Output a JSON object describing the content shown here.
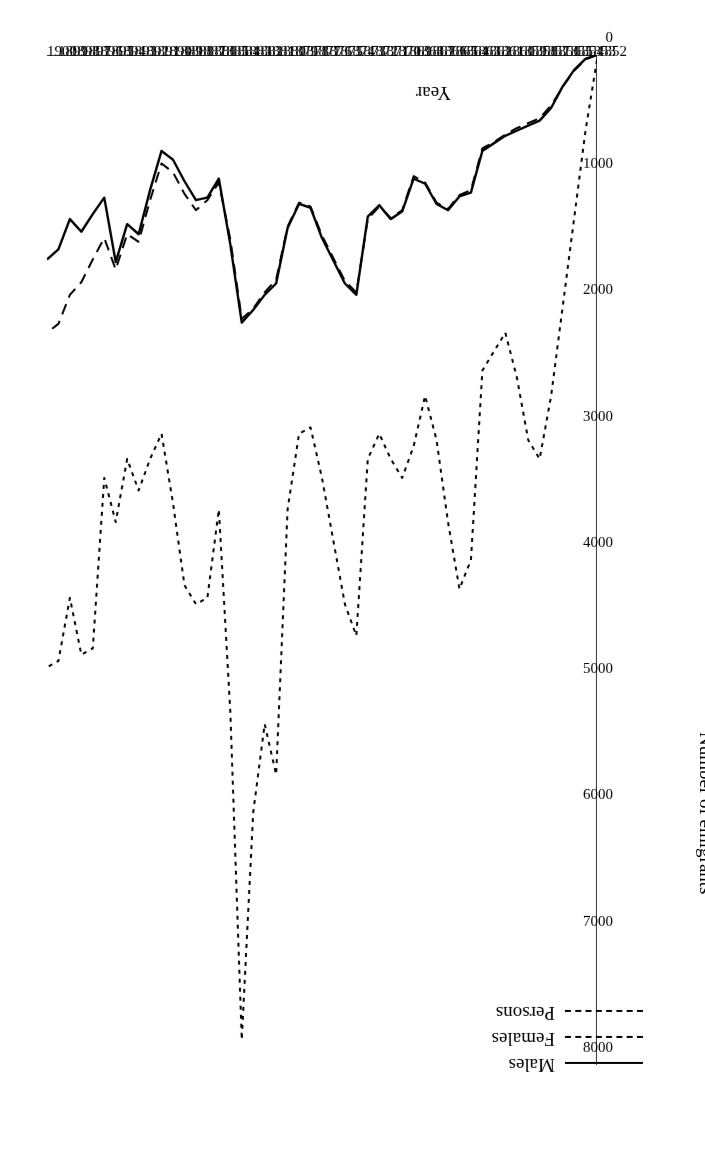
{
  "chart_data": {
    "type": "line",
    "title": "",
    "xlabel": "Year",
    "ylabel": "Number of emigrants",
    "xlim": [
      1852,
      1900
    ],
    "ylim": [
      0,
      8000
    ],
    "yticks": [
      0,
      1000,
      2000,
      3000,
      4000,
      5000,
      6000,
      7000,
      8000
    ],
    "ytick_labels": [
      "0",
      "1000",
      "2000",
      "3000",
      "4000",
      "5000",
      "6000",
      "7000",
      "8000"
    ],
    "grid": false,
    "legend_position": "upper-left",
    "rotation_deg": 180,
    "x": [
      1852,
      1853,
      1854,
      1855,
      1856,
      1857,
      1858,
      1859,
      1860,
      1861,
      1862,
      1863,
      1864,
      1865,
      1866,
      1867,
      1868,
      1869,
      1870,
      1871,
      1872,
      1873,
      1874,
      1875,
      1876,
      1877,
      1878,
      1879,
      1880,
      1881,
      1882,
      1883,
      1884,
      1885,
      1886,
      1887,
      1888,
      1889,
      1890,
      1891,
      1892,
      1893,
      1894,
      1895,
      1896,
      1897,
      1898,
      1899,
      1900
    ],
    "xtick_labels": [
      "1852",
      "1853",
      "1854",
      "1855",
      "1856",
      "1857",
      "1858",
      "1859",
      "1860",
      "1861",
      "1862",
      "1863",
      "1864",
      "1865",
      "1866",
      "1867",
      "1868",
      "1869",
      "1870",
      "1871",
      "1872",
      "1873",
      "1874",
      "1875",
      "1876",
      "1877",
      "1878",
      "1879",
      "1880",
      "1881",
      "1882",
      "1883",
      "1884",
      "1885",
      "1886",
      "1887",
      "1888",
      "1889",
      "1890",
      "1891",
      "1892",
      "1893",
      "1894",
      "1895",
      "1896",
      "1897",
      "1898",
      "1899",
      "1900"
    ],
    "series": [
      {
        "name": "Males",
        "style": "solid",
        "color": "#000000",
        "values": [
          0,
          30,
          120,
          250,
          420,
          520,
          560,
          600,
          640,
          700,
          760,
          1090,
          1120,
          1230,
          1180,
          1020,
          980,
          1240,
          1300,
          1190,
          1280,
          1900,
          1810,
          1630,
          1450,
          1210,
          1180,
          1370,
          1810,
          1900,
          2020,
          2120,
          1500,
          980,
          1130,
          1150,
          1000,
          830,
          760,
          1070,
          1420,
          1340,
          1640,
          1130,
          1260,
          1400,
          1300,
          1540,
          1620
        ]
      },
      {
        "name": "Females",
        "style": "dashed",
        "color": "#000000",
        "values": [
          0,
          35,
          125,
          255,
          400,
          500,
          540,
          580,
          630,
          690,
          740,
          1070,
          1110,
          1220,
          1170,
          1010,
          960,
          1230,
          1290,
          1200,
          1300,
          1880,
          1790,
          1610,
          1430,
          1200,
          1170,
          1360,
          1780,
          1880,
          2010,
          2090,
          1460,
          1010,
          1150,
          1230,
          1100,
          930,
          860,
          1150,
          1480,
          1420,
          1700,
          1450,
          1620,
          1800,
          1900,
          2130,
          2200
        ]
      },
      {
        "name": "Persons",
        "style": "dotted",
        "color": "#000000",
        "values": [
          40,
          600,
          1300,
          2000,
          2700,
          3200,
          3050,
          2550,
          2200,
          2350,
          2500,
          4000,
          4230,
          3700,
          3050,
          2700,
          3100,
          3350,
          3200,
          3000,
          3200,
          4600,
          4350,
          3850,
          3350,
          2950,
          3000,
          3600,
          5700,
          5300,
          6000,
          7800,
          5200,
          3600,
          4300,
          4350,
          4200,
          3550,
          3000,
          3200,
          3450,
          3200,
          3700,
          3350,
          4700,
          4750,
          4300,
          4800,
          4850
        ]
      }
    ]
  },
  "legend": {
    "items": [
      {
        "label": "Males",
        "style": "solid"
      },
      {
        "label": "Females",
        "style": "dashed"
      },
      {
        "label": "Persons",
        "style": "dotted"
      }
    ]
  }
}
